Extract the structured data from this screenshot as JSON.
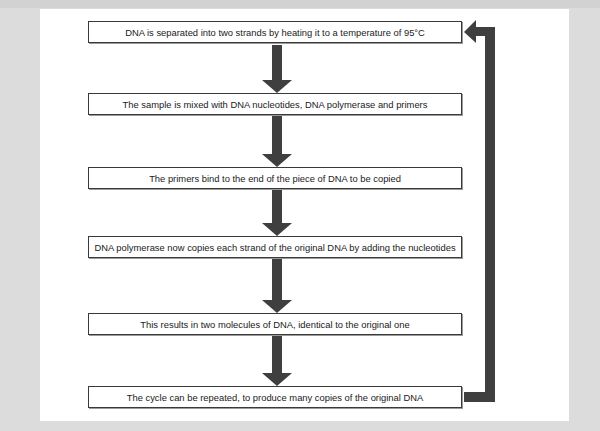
{
  "diagram": {
    "type": "flowchart",
    "topic": "Polymerase chain reaction cycle",
    "steps": [
      {
        "text": "DNA is separated into two strands by heating it to a temperature of 95°C"
      },
      {
        "text": "The sample is mixed with DNA nucleotides, DNA polymerase and primers"
      },
      {
        "text": "The primers bind to the end of the piece of DNA to be copied"
      },
      {
        "text": "DNA polymerase now copies each strand of the original DNA by adding the nucleotides"
      },
      {
        "text": "This results in two molecules of DNA, identical to the original one"
      },
      {
        "text": "The cycle can be repeated, to produce many copies of the original DNA"
      }
    ],
    "connections": [
      {
        "from": 0,
        "to": 1,
        "type": "down-arrow"
      },
      {
        "from": 1,
        "to": 2,
        "type": "down-arrow"
      },
      {
        "from": 2,
        "to": 3,
        "type": "down-arrow"
      },
      {
        "from": 3,
        "to": 4,
        "type": "down-arrow"
      },
      {
        "from": 4,
        "to": 5,
        "type": "down-arrow"
      },
      {
        "from": 5,
        "to": 0,
        "type": "loop-back-arrow"
      }
    ],
    "colors": {
      "arrow": "#3f3f3f",
      "box_border": "#3a3a3a",
      "panel": "#ffffff",
      "background": "#dcdcdc"
    }
  }
}
